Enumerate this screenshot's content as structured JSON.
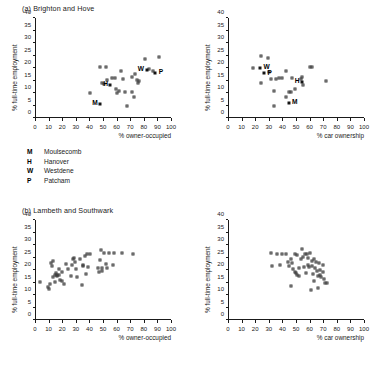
{
  "figure": {
    "panels": [
      {
        "id": "brighton-owner-occupied",
        "title": "(a) Brighton and Hove",
        "show_title": true
      },
      {
        "id": "brighton-car-ownership",
        "title": "",
        "show_title": false
      },
      {
        "id": "lambeth-owner-occupied",
        "title": "(b) Lambeth and Southwark",
        "show_title": true
      },
      {
        "id": "lambeth-car-ownership",
        "title": "",
        "show_title": false
      }
    ]
  },
  "key": {
    "items": [
      {
        "code": "M",
        "name": "Moulsecomb"
      },
      {
        "code": "H",
        "name": "Hanover"
      },
      {
        "code": "W",
        "name": "Westdene"
      },
      {
        "code": "P",
        "name": "Patcham"
      }
    ]
  },
  "chart_data": [
    {
      "type": "scatter",
      "id": "brighton-owner-occupied",
      "title": "(a) Brighton and Hove",
      "xlabel": "% owner-occupied",
      "ylabel": "% full-time employment",
      "xlim": [
        0,
        100
      ],
      "ylim": [
        0,
        40
      ],
      "xticks": [
        0,
        10,
        20,
        30,
        40,
        50,
        60,
        70,
        80,
        90,
        100
      ],
      "yticks": [
        0,
        5,
        10,
        15,
        20,
        25,
        30,
        35,
        40
      ],
      "grid": false,
      "legend": "none",
      "points": [
        {
          "x": 40.5,
          "y": 10.0
        },
        {
          "x": 47.5,
          "y": 20.5
        },
        {
          "x": 49.0,
          "y": 14.0
        },
        {
          "x": 50.5,
          "y": 13.8
        },
        {
          "x": 52.5,
          "y": 20.4
        },
        {
          "x": 53.0,
          "y": 15.3
        },
        {
          "x": 56.5,
          "y": 15.9
        },
        {
          "x": 58.5,
          "y": 16.0
        },
        {
          "x": 59.5,
          "y": 11.6
        },
        {
          "x": 60.0,
          "y": 10.2
        },
        {
          "x": 62.0,
          "y": 11.0
        },
        {
          "x": 63.5,
          "y": 18.8
        },
        {
          "x": 64.5,
          "y": 15.6
        },
        {
          "x": 66.0,
          "y": 10.3
        },
        {
          "x": 68.0,
          "y": 5.0
        },
        {
          "x": 71.0,
          "y": 16.5
        },
        {
          "x": 71.5,
          "y": 10.6
        },
        {
          "x": 72.5,
          "y": 8.3
        },
        {
          "x": 73.5,
          "y": 17.6
        },
        {
          "x": 75.0,
          "y": 15.3
        },
        {
          "x": 76.0,
          "y": 14.2
        },
        {
          "x": 76.2,
          "y": 15.0
        },
        {
          "x": 81.0,
          "y": 23.6
        },
        {
          "x": 84.0,
          "y": 19.6
        },
        {
          "x": 86.5,
          "y": 18.7
        },
        {
          "x": 91.5,
          "y": 24.5
        }
      ],
      "labelled_points": [
        {
          "code": "M",
          "x": 48.0,
          "y": 5.8,
          "label_side": "left"
        },
        {
          "code": "H",
          "x": 55.5,
          "y": 13.2,
          "label_side": "left"
        },
        {
          "code": "W",
          "x": 82.0,
          "y": 19.3,
          "label_side": "left"
        },
        {
          "code": "P",
          "x": 88.5,
          "y": 18.0,
          "label_side": "right"
        }
      ]
    },
    {
      "type": "scatter",
      "id": "brighton-car-ownership",
      "title": "",
      "xlabel": "% car ownership",
      "ylabel": "% full-time employment",
      "xlim": [
        0,
        100
      ],
      "ylim": [
        0,
        40
      ],
      "xticks": [
        0,
        10,
        20,
        30,
        40,
        50,
        60,
        70,
        80,
        90,
        100
      ],
      "yticks": [
        0,
        5,
        10,
        15,
        20,
        25,
        30,
        35,
        40
      ],
      "grid": false,
      "legend": "none",
      "points": [
        {
          "x": 18.5,
          "y": 20.2
        },
        {
          "x": 24.5,
          "y": 25.0
        },
        {
          "x": 24.0,
          "y": 14.0
        },
        {
          "x": 29.5,
          "y": 24.0
        },
        {
          "x": 30.5,
          "y": 18.6
        },
        {
          "x": 31.5,
          "y": 15.7
        },
        {
          "x": 33.5,
          "y": 5.0
        },
        {
          "x": 34.0,
          "y": 10.8
        },
        {
          "x": 35.5,
          "y": 15.8
        },
        {
          "x": 37.5,
          "y": 16.2
        },
        {
          "x": 39.5,
          "y": 16.1
        },
        {
          "x": 42.5,
          "y": 8.4
        },
        {
          "x": 43.0,
          "y": 18.8
        },
        {
          "x": 44.5,
          "y": 10.4
        },
        {
          "x": 46.5,
          "y": 10.6
        },
        {
          "x": 47.0,
          "y": 16.2
        },
        {
          "x": 49.5,
          "y": 11.8
        },
        {
          "x": 53.5,
          "y": 15.6
        },
        {
          "x": 54.5,
          "y": 16.5
        },
        {
          "x": 55.5,
          "y": 13.1
        },
        {
          "x": 60.0,
          "y": 20.4
        },
        {
          "x": 62.0,
          "y": 20.4
        },
        {
          "x": 72.0,
          "y": 14.9
        }
      ],
      "labelled_points": [
        {
          "code": "W",
          "x": 23.5,
          "y": 20.1,
          "label_side": "right"
        },
        {
          "code": "P",
          "x": 26.5,
          "y": 17.9,
          "label_side": "right"
        },
        {
          "code": "H",
          "x": 54.5,
          "y": 14.6,
          "label_side": "left"
        },
        {
          "code": "M",
          "x": 44.5,
          "y": 6.0,
          "label_side": "right"
        }
      ]
    },
    {
      "type": "scatter",
      "id": "lambeth-owner-occupied",
      "title": "(b) Lambeth and Southwark",
      "xlabel": "% owner-occupied",
      "ylabel": "% full-time employment",
      "xlim": [
        0,
        100
      ],
      "ylim": [
        0,
        40
      ],
      "xticks": [
        0,
        10,
        20,
        30,
        40,
        50,
        60,
        70,
        80,
        90,
        100
      ],
      "yticks": [
        0,
        5,
        10,
        15,
        20,
        25,
        30,
        35,
        40
      ],
      "grid": false,
      "legend": "none",
      "points": [
        {
          "x": 3.5,
          "y": 15.2
        },
        {
          "x": 9.5,
          "y": 13.1
        },
        {
          "x": 10.0,
          "y": 12.5
        },
        {
          "x": 11.0,
          "y": 14.5
        },
        {
          "x": 11.5,
          "y": 23.0
        },
        {
          "x": 12.5,
          "y": 21.8
        },
        {
          "x": 13.0,
          "y": 17.3
        },
        {
          "x": 13.5,
          "y": 23.5
        },
        {
          "x": 14.5,
          "y": 18.0
        },
        {
          "x": 15.0,
          "y": 15.4
        },
        {
          "x": 15.5,
          "y": 19.0
        },
        {
          "x": 16.0,
          "y": 17.6
        },
        {
          "x": 16.5,
          "y": 18.2
        },
        {
          "x": 17.5,
          "y": 20.3
        },
        {
          "x": 18.0,
          "y": 18.0
        },
        {
          "x": 18.5,
          "y": 16.0
        },
        {
          "x": 19.5,
          "y": 15.6
        },
        {
          "x": 20.0,
          "y": 19.4
        },
        {
          "x": 21.0,
          "y": 14.6
        },
        {
          "x": 22.5,
          "y": 22.3
        },
        {
          "x": 24.5,
          "y": 20.5
        },
        {
          "x": 26.5,
          "y": 17.5
        },
        {
          "x": 27.0,
          "y": 22.0
        },
        {
          "x": 28.0,
          "y": 24.6
        },
        {
          "x": 28.5,
          "y": 25.0
        },
        {
          "x": 29.5,
          "y": 23.4
        },
        {
          "x": 30.0,
          "y": 20.6
        },
        {
          "x": 31.0,
          "y": 17.3
        },
        {
          "x": 33.0,
          "y": 24.4
        },
        {
          "x": 34.5,
          "y": 14.1
        },
        {
          "x": 35.0,
          "y": 21.6
        },
        {
          "x": 35.5,
          "y": 22.0
        },
        {
          "x": 36.5,
          "y": 25.8
        },
        {
          "x": 37.5,
          "y": 18.4
        },
        {
          "x": 38.0,
          "y": 26.4
        },
        {
          "x": 39.0,
          "y": 21.3
        },
        {
          "x": 40.5,
          "y": 26.3
        },
        {
          "x": 46.5,
          "y": 21.0
        },
        {
          "x": 47.0,
          "y": 19.4
        },
        {
          "x": 47.5,
          "y": 24.2
        },
        {
          "x": 48.5,
          "y": 28.0
        },
        {
          "x": 49.0,
          "y": 20.8
        },
        {
          "x": 49.5,
          "y": 19.8
        },
        {
          "x": 50.5,
          "y": 26.8
        },
        {
          "x": 52.5,
          "y": 22.4
        },
        {
          "x": 53.0,
          "y": 20.9
        },
        {
          "x": 54.5,
          "y": 27.0
        },
        {
          "x": 57.0,
          "y": 22.2
        },
        {
          "x": 58.0,
          "y": 27.0
        },
        {
          "x": 64.0,
          "y": 27.0
        },
        {
          "x": 72.0,
          "y": 26.5
        }
      ],
      "labelled_points": []
    },
    {
      "type": "scatter",
      "id": "lambeth-car-ownership",
      "title": "",
      "xlabel": "% car ownership",
      "ylabel": "% full-time employment",
      "xlim": [
        0,
        100
      ],
      "ylim": [
        0,
        40
      ],
      "xticks": [
        0,
        10,
        20,
        30,
        40,
        50,
        60,
        70,
        80,
        90,
        100
      ],
      "yticks": [
        0,
        5,
        10,
        15,
        20,
        25,
        30,
        35,
        40
      ],
      "grid": false,
      "legend": "none",
      "points": [
        {
          "x": 31.5,
          "y": 27.0
        },
        {
          "x": 32.5,
          "y": 21.5
        },
        {
          "x": 36.0,
          "y": 26.4
        },
        {
          "x": 38.5,
          "y": 22.0
        },
        {
          "x": 40.0,
          "y": 26.5
        },
        {
          "x": 42.5,
          "y": 26.5
        },
        {
          "x": 44.0,
          "y": 23.2
        },
        {
          "x": 45.0,
          "y": 21.5
        },
        {
          "x": 46.0,
          "y": 24.4
        },
        {
          "x": 46.5,
          "y": 13.8
        },
        {
          "x": 47.0,
          "y": 22.8
        },
        {
          "x": 48.0,
          "y": 20.3
        },
        {
          "x": 49.0,
          "y": 26.6
        },
        {
          "x": 49.5,
          "y": 19.4
        },
        {
          "x": 50.0,
          "y": 18.8
        },
        {
          "x": 50.5,
          "y": 18.2
        },
        {
          "x": 51.0,
          "y": 26.0
        },
        {
          "x": 52.0,
          "y": 20.8
        },
        {
          "x": 52.5,
          "y": 17.8
        },
        {
          "x": 53.5,
          "y": 24.5
        },
        {
          "x": 54.5,
          "y": 28.4
        },
        {
          "x": 55.0,
          "y": 25.2
        },
        {
          "x": 56.0,
          "y": 21.4
        },
        {
          "x": 56.5,
          "y": 26.4
        },
        {
          "x": 57.0,
          "y": 19.0
        },
        {
          "x": 58.0,
          "y": 26.6
        },
        {
          "x": 58.5,
          "y": 22.0
        },
        {
          "x": 59.0,
          "y": 25.0
        },
        {
          "x": 59.5,
          "y": 21.3
        },
        {
          "x": 60.5,
          "y": 27.0
        },
        {
          "x": 61.0,
          "y": 12.2
        },
        {
          "x": 61.5,
          "y": 23.8
        },
        {
          "x": 62.0,
          "y": 21.6
        },
        {
          "x": 62.5,
          "y": 18.3
        },
        {
          "x": 63.0,
          "y": 15.6
        },
        {
          "x": 63.5,
          "y": 24.6
        },
        {
          "x": 64.0,
          "y": 21.0
        },
        {
          "x": 65.0,
          "y": 23.2
        },
        {
          "x": 65.5,
          "y": 19.6
        },
        {
          "x": 66.0,
          "y": 17.6
        },
        {
          "x": 66.5,
          "y": 13.0
        },
        {
          "x": 67.0,
          "y": 22.8
        },
        {
          "x": 67.5,
          "y": 20.2
        },
        {
          "x": 68.0,
          "y": 18.0
        },
        {
          "x": 68.5,
          "y": 17.2
        },
        {
          "x": 69.5,
          "y": 22.0
        },
        {
          "x": 70.0,
          "y": 19.3
        },
        {
          "x": 70.5,
          "y": 16.3
        },
        {
          "x": 71.5,
          "y": 15.0
        },
        {
          "x": 73.0,
          "y": 14.9
        }
      ],
      "labelled_points": []
    }
  ]
}
